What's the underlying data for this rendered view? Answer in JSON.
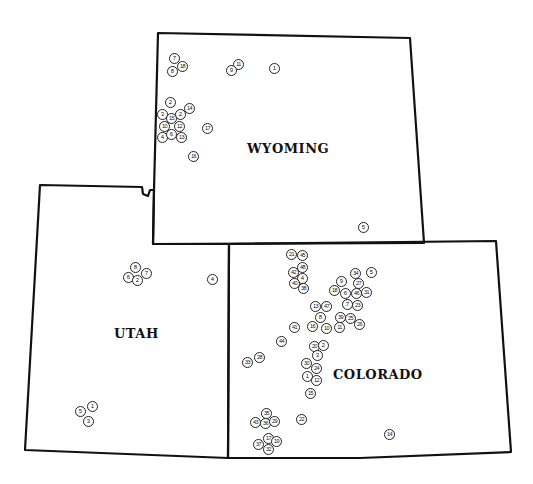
{
  "map": {
    "states": [
      {
        "name": "WYOMING",
        "label_pos": [
          247,
          150
        ],
        "outline": "158,33 410,38 424,243 153,244 154,190",
        "markers": [
          {
            "n": "7",
            "x": 174,
            "y": 58
          },
          {
            "n": "18",
            "x": 182,
            "y": 66
          },
          {
            "n": "8",
            "x": 172,
            "y": 71
          },
          {
            "n": "11",
            "x": 238,
            "y": 64
          },
          {
            "n": "9",
            "x": 231,
            "y": 70
          },
          {
            "n": "1",
            "x": 274,
            "y": 68
          },
          {
            "n": "2",
            "x": 170,
            "y": 102
          },
          {
            "n": "14",
            "x": 189,
            "y": 108
          },
          {
            "n": "3",
            "x": 162,
            "y": 114
          },
          {
            "n": "15",
            "x": 171,
            "y": 118
          },
          {
            "n": "2",
            "x": 180,
            "y": 114
          },
          {
            "n": "10",
            "x": 164,
            "y": 126
          },
          {
            "n": "12",
            "x": 179,
            "y": 126
          },
          {
            "n": "17",
            "x": 207,
            "y": 128
          },
          {
            "n": "4",
            "x": 162,
            "y": 137
          },
          {
            "n": "6",
            "x": 171,
            "y": 134
          },
          {
            "n": "13",
            "x": 181,
            "y": 137
          },
          {
            "n": "16",
            "x": 193,
            "y": 156
          },
          {
            "n": "5",
            "x": 363,
            "y": 227
          }
        ]
      },
      {
        "name": "UTAH",
        "label_pos": [
          114,
          335
        ],
        "outline": "40,185 142,187 143,194 148,196 150,190 154,190 153,244 229,244 228,458 25,450",
        "markers": [
          {
            "n": "8",
            "x": 135,
            "y": 267
          },
          {
            "n": "7",
            "x": 146,
            "y": 273
          },
          {
            "n": "6",
            "x": 128,
            "y": 277
          },
          {
            "n": "2",
            "x": 137,
            "y": 280
          },
          {
            "n": "4",
            "x": 212,
            "y": 279
          },
          {
            "n": "1",
            "x": 92,
            "y": 406
          },
          {
            "n": "5",
            "x": 80,
            "y": 411
          },
          {
            "n": "3",
            "x": 88,
            "y": 421
          }
        ]
      },
      {
        "name": "COLORADO",
        "label_pos": [
          333,
          376
        ],
        "outline": "229,244 496,241 511,452 360,458 228,458",
        "markers": [
          {
            "n": "21",
            "x": 291,
            "y": 254
          },
          {
            "n": "45",
            "x": 302,
            "y": 255
          },
          {
            "n": "48",
            "x": 302,
            "y": 267
          },
          {
            "n": "42",
            "x": 293,
            "y": 272
          },
          {
            "n": "4",
            "x": 302,
            "y": 278
          },
          {
            "n": "40",
            "x": 294,
            "y": 283
          },
          {
            "n": "38",
            "x": 303,
            "y": 288
          },
          {
            "n": "9",
            "x": 341,
            "y": 281
          },
          {
            "n": "34",
            "x": 355,
            "y": 273
          },
          {
            "n": "5",
            "x": 371,
            "y": 272
          },
          {
            "n": "27",
            "x": 358,
            "y": 283
          },
          {
            "n": "18",
            "x": 334,
            "y": 290
          },
          {
            "n": "6",
            "x": 345,
            "y": 293
          },
          {
            "n": "46",
            "x": 356,
            "y": 293
          },
          {
            "n": "31",
            "x": 366,
            "y": 292
          },
          {
            "n": "7",
            "x": 347,
            "y": 304
          },
          {
            "n": "23",
            "x": 357,
            "y": 305
          },
          {
            "n": "13",
            "x": 315,
            "y": 306
          },
          {
            "n": "47",
            "x": 326,
            "y": 306
          },
          {
            "n": "8",
            "x": 320,
            "y": 317
          },
          {
            "n": "39",
            "x": 340,
            "y": 317
          },
          {
            "n": "25",
            "x": 350,
            "y": 318
          },
          {
            "n": "26",
            "x": 359,
            "y": 324
          },
          {
            "n": "41",
            "x": 294,
            "y": 327
          },
          {
            "n": "16",
            "x": 312,
            "y": 326
          },
          {
            "n": "10",
            "x": 326,
            "y": 328
          },
          {
            "n": "11",
            "x": 339,
            "y": 327
          },
          {
            "n": "44",
            "x": 281,
            "y": 341
          },
          {
            "n": "20",
            "x": 314,
            "y": 346
          },
          {
            "n": "2",
            "x": 323,
            "y": 345
          },
          {
            "n": "3",
            "x": 317,
            "y": 355
          },
          {
            "n": "28",
            "x": 259,
            "y": 357
          },
          {
            "n": "33",
            "x": 247,
            "y": 362
          },
          {
            "n": "30",
            "x": 306,
            "y": 363
          },
          {
            "n": "24",
            "x": 316,
            "y": 368
          },
          {
            "n": "1",
            "x": 307,
            "y": 376
          },
          {
            "n": "12",
            "x": 316,
            "y": 380
          },
          {
            "n": "15",
            "x": 310,
            "y": 393
          },
          {
            "n": "35",
            "x": 266,
            "y": 413
          },
          {
            "n": "43",
            "x": 255,
            "y": 422
          },
          {
            "n": "36",
            "x": 265,
            "y": 423
          },
          {
            "n": "29",
            "x": 274,
            "y": 421
          },
          {
            "n": "22",
            "x": 301,
            "y": 419
          },
          {
            "n": "17",
            "x": 268,
            "y": 438
          },
          {
            "n": "19",
            "x": 276,
            "y": 441
          },
          {
            "n": "37",
            "x": 258,
            "y": 444
          },
          {
            "n": "32",
            "x": 268,
            "y": 449
          },
          {
            "n": "14",
            "x": 389,
            "y": 434
          }
        ]
      }
    ]
  }
}
